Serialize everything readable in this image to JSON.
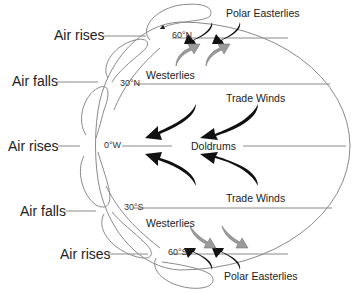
{
  "diagram": {
    "side_labels": [
      {
        "id": "air-rises-north",
        "text": "Air rises"
      },
      {
        "id": "air-falls-north",
        "text": "Air falls"
      },
      {
        "id": "air-rises-equator",
        "text": "Air rises"
      },
      {
        "id": "air-falls-south",
        "text": "Air falls"
      },
      {
        "id": "air-rises-south",
        "text": "Air rises"
      }
    ],
    "latitudes": [
      {
        "id": "lat-60n",
        "text": "60°N"
      },
      {
        "id": "lat-30n",
        "text": "30°N"
      },
      {
        "id": "lat-0",
        "text": "0°W"
      },
      {
        "id": "lat-30s",
        "text": "30°S"
      },
      {
        "id": "lat-60s",
        "text": "60°S"
      }
    ],
    "wind_labels": [
      {
        "id": "polar-easterlies-north",
        "text": "Polar  Easterlies"
      },
      {
        "id": "westerlies-north",
        "text": "Westerlies"
      },
      {
        "id": "trade-winds-north",
        "text": "Trade Winds"
      },
      {
        "id": "doldrums",
        "text": "Doldrums"
      },
      {
        "id": "trade-winds-south",
        "text": "Trade Winds"
      },
      {
        "id": "westerlies-south",
        "text": "Westerlies"
      },
      {
        "id": "polar-easterlies-south",
        "text": "Polar  Easterlies"
      }
    ],
    "colors": {
      "outline": "#8a8a8a",
      "black_arrow": "#111111",
      "grey_arrow": "#9a9a9a",
      "text": "#222222"
    }
  }
}
